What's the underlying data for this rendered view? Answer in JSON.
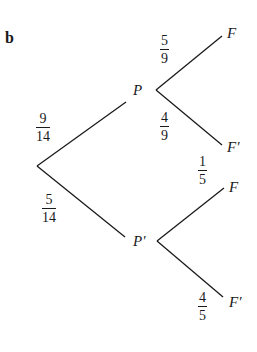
{
  "part_label": "b",
  "nodes": {
    "root": "",
    "P": "P",
    "P_prime": "P'",
    "F_top": "F",
    "F_prime_top": "F′",
    "F_bottom": "F",
    "F_prime_bottom": "F′"
  },
  "branches": {
    "root_to_P": {
      "num": "9",
      "den": "14"
    },
    "root_to_P_prime": {
      "num": "5",
      "den": "14"
    },
    "P_to_F": {
      "num": "5",
      "den": "9"
    },
    "P_to_F_prime": {
      "num": "4",
      "den": "9"
    },
    "P_prime_to_F": {
      "num": "1",
      "den": "5"
    },
    "P_prime_to_F_prime": {
      "num": "4",
      "den": "5"
    }
  },
  "colors": {
    "ink": "#1a1a1a",
    "background": "#ffffff"
  }
}
